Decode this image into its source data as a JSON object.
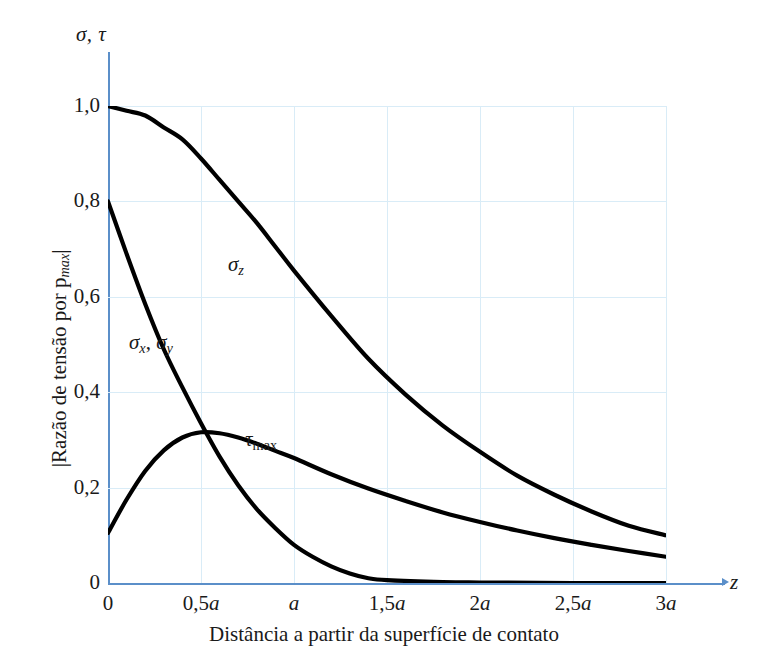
{
  "chart_data": {
    "type": "line",
    "title": "",
    "xlabel": "Distância a partir da superfície de contato",
    "xaxis_symbol": "z",
    "ylabel": "|Razão de tensão por p",
    "ylabel_sub": "max",
    "ylabel_close": "|",
    "yaxis_symbol": "σ, τ",
    "grid": true,
    "legend_position": "inline-annotations",
    "xlim": [
      0,
      3
    ],
    "ylim": [
      0,
      1.0
    ],
    "x_ticks": [
      {
        "value": 0,
        "label": "0",
        "italic_suffix": ""
      },
      {
        "value": 0.5,
        "label": "0,5",
        "italic_suffix": "a"
      },
      {
        "value": 1.0,
        "label": "",
        "italic_suffix": "a"
      },
      {
        "value": 1.5,
        "label": "1,5",
        "italic_suffix": "a"
      },
      {
        "value": 2.0,
        "label": "2",
        "italic_suffix": "a"
      },
      {
        "value": 2.5,
        "label": "2,5",
        "italic_suffix": "a"
      },
      {
        "value": 3.0,
        "label": "3",
        "italic_suffix": "a"
      }
    ],
    "y_ticks": [
      {
        "value": 0,
        "label": "0"
      },
      {
        "value": 0.2,
        "label": "0,2"
      },
      {
        "value": 0.4,
        "label": "0,4"
      },
      {
        "value": 0.6,
        "label": "0,6"
      },
      {
        "value": 0.8,
        "label": "0,8"
      },
      {
        "value": 1.0,
        "label": "1,0"
      }
    ],
    "series": [
      {
        "name": "sigma_z",
        "label_main": "σ",
        "label_sub": "z",
        "color": "#000000",
        "x": [
          0,
          0.1,
          0.2,
          0.3,
          0.4,
          0.5,
          0.6,
          0.7,
          0.8,
          0.9,
          1.0,
          1.2,
          1.4,
          1.6,
          1.8,
          2.0,
          2.2,
          2.4,
          2.6,
          2.8,
          3.0
        ],
        "values": [
          1.0,
          0.99,
          0.98,
          0.955,
          0.93,
          0.89,
          0.845,
          0.8,
          0.755,
          0.705,
          0.655,
          0.56,
          0.47,
          0.395,
          0.33,
          0.275,
          0.225,
          0.185,
          0.15,
          0.12,
          0.1
        ]
      },
      {
        "name": "sigma_x_sigma_y",
        "label_main": "σ",
        "label_sub": "x",
        "label_main2": "σ",
        "label_sub2": "y",
        "color": "#000000",
        "x": [
          0,
          0.1,
          0.2,
          0.3,
          0.4,
          0.5,
          0.6,
          0.7,
          0.8,
          0.9,
          1.0,
          1.1,
          1.2,
          1.3,
          1.4,
          1.5,
          1.8,
          2.0,
          2.5,
          3.0
        ],
        "values": [
          0.8,
          0.69,
          0.585,
          0.49,
          0.41,
          0.335,
          0.265,
          0.205,
          0.155,
          0.115,
          0.08,
          0.055,
          0.035,
          0.02,
          0.01,
          0.006,
          0.002,
          0.001,
          0.0,
          0.0
        ]
      },
      {
        "name": "tau_max",
        "label_main": "τ",
        "label_sub": "max",
        "color": "#000000",
        "x": [
          0,
          0.1,
          0.2,
          0.3,
          0.4,
          0.5,
          0.6,
          0.7,
          0.8,
          0.9,
          1.0,
          1.2,
          1.4,
          1.6,
          1.8,
          2.0,
          2.2,
          2.4,
          2.6,
          2.8,
          3.0
        ],
        "values": [
          0.105,
          0.175,
          0.235,
          0.278,
          0.305,
          0.316,
          0.314,
          0.305,
          0.292,
          0.277,
          0.262,
          0.228,
          0.198,
          0.172,
          0.148,
          0.128,
          0.11,
          0.094,
          0.08,
          0.067,
          0.055
        ]
      }
    ],
    "colors": {
      "axis": "#5b8fc9",
      "grid": "#d9ecf7",
      "curve": "#000000",
      "text": "#1a1a1a",
      "background": "#ffffff"
    }
  }
}
